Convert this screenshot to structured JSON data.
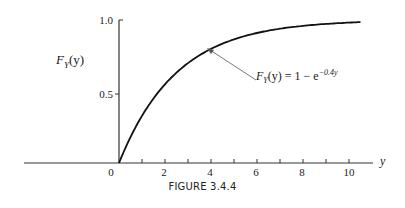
{
  "chart_data": {
    "type": "line",
    "title": "",
    "caption": "FIGURE 3.4.4",
    "xlabel": "y",
    "ylabel": "F_Y(y)",
    "xlim": [
      0,
      10.5
    ],
    "ylim": [
      0,
      1.0
    ],
    "x_ticks": [
      0,
      1,
      2,
      3,
      4,
      5,
      6,
      7,
      8,
      9,
      10
    ],
    "x_tick_labels": [
      "0",
      "2",
      "4",
      "6",
      "8",
      "10"
    ],
    "y_tick_labels": [
      "0.5",
      "1.0"
    ],
    "grid": false,
    "series": [
      {
        "name": "F_Y(y) = 1 - e^{-0.4y}",
        "x": [
          0,
          1,
          2,
          3,
          4,
          5,
          6,
          7,
          8,
          9,
          10,
          10.5
        ],
        "values": [
          0,
          0.33,
          0.55,
          0.7,
          0.8,
          0.86,
          0.91,
          0.94,
          0.96,
          0.97,
          0.98,
          0.985
        ]
      }
    ],
    "annotations": [
      {
        "text": "F_Y(y) = 1 − e^{−0.4y}",
        "arrow_to_x": 4.2,
        "arrow_to_y": 0.81
      }
    ]
  },
  "labels": {
    "caption": "FIGURE 3.4.4",
    "ylabel_main": "F",
    "ylabel_sub": "Y",
    "ylabel_arg": "(y)",
    "xname": "y",
    "annot_main": "F",
    "annot_sub": "Y",
    "annot_rest": "(y) = 1 − e",
    "annot_exp": "−0.4y",
    "yticks": [
      "1.0",
      "0.5"
    ],
    "xticks": [
      "0",
      "2",
      "4",
      "6",
      "8",
      "10"
    ]
  }
}
